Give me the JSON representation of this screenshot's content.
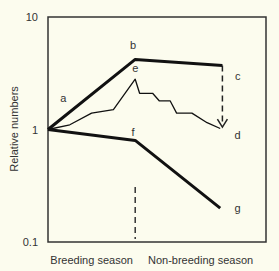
{
  "chart_data": {
    "type": "line",
    "title": "",
    "xlabel": "",
    "ylabel": "Relative numbers",
    "yscale": "log",
    "ylim": [
      0.1,
      10
    ],
    "xlim": [
      0,
      1
    ],
    "y_ticks": [
      {
        "value": 10,
        "label": "10"
      },
      {
        "value": 1,
        "label": "1"
      },
      {
        "value": 0.1,
        "label": "0.1"
      }
    ],
    "x_category_labels": [
      {
        "label": "Breeding season",
        "x": 0.2
      },
      {
        "label": "Non-breeding season",
        "x": 0.7
      }
    ],
    "season_divider_x": 0.4,
    "grid": false,
    "series": [
      {
        "name": "upper",
        "style": "thick",
        "points": [
          [
            0,
            1
          ],
          [
            0.4,
            4.2
          ],
          [
            0.8,
            3.7
          ]
        ]
      },
      {
        "name": "observed",
        "style": "thin",
        "points": [
          [
            0,
            1
          ],
          [
            0.1,
            1.1
          ],
          [
            0.2,
            1.4
          ],
          [
            0.3,
            1.5
          ],
          [
            0.4,
            2.8
          ],
          [
            0.42,
            2.1
          ],
          [
            0.48,
            2.1
          ],
          [
            0.51,
            1.8
          ],
          [
            0.56,
            1.8
          ],
          [
            0.59,
            1.4
          ],
          [
            0.66,
            1.4
          ],
          [
            0.73,
            1.15
          ],
          [
            0.79,
            1.02
          ]
        ]
      },
      {
        "name": "lower",
        "style": "thick",
        "points": [
          [
            0,
            1
          ],
          [
            0.4,
            0.8
          ],
          [
            0.79,
            0.2
          ]
        ]
      }
    ],
    "arrow": {
      "from": [
        0.8,
        3.7
      ],
      "to": [
        0.8,
        1.05
      ],
      "style": "dashed"
    },
    "annotations": [
      {
        "text": "a",
        "x": 0.07,
        "y": 1.9
      },
      {
        "text": "b",
        "x": 0.39,
        "y": 5.6
      },
      {
        "text": "c",
        "x": 0.87,
        "y": 3.0
      },
      {
        "text": "d",
        "x": 0.87,
        "y": 0.9
      },
      {
        "text": "e",
        "x": 0.4,
        "y": 3.5
      },
      {
        "text": "f",
        "x": 0.39,
        "y": 0.95
      },
      {
        "text": "g",
        "x": 0.87,
        "y": 0.2
      }
    ]
  }
}
